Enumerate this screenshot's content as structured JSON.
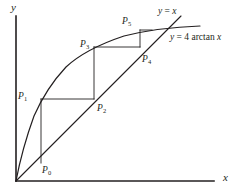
{
  "figure": {
    "kind": "cobweb-diagram",
    "background_color": "#ffffff",
    "ink_color": "#231f20"
  },
  "axes": {
    "x_axis_label": "x",
    "y_axis_label": "y",
    "x_axis_name": "x-axis",
    "y_axis_name": "y-axis",
    "origin_px": [
      16,
      181
    ],
    "x_axis_end_px": [
      214,
      181
    ],
    "y_axis_top_px": [
      16,
      16
    ]
  },
  "curve_labels": {
    "identity_line": "y = x",
    "identity_line_parts": {
      "lhs": "y",
      "eq": " = ",
      "rhs": "x"
    },
    "function_curve": "y = 4 arctan x",
    "function_curve_parts": {
      "lhs": "y",
      "eq": " = ",
      "coef": "4 ",
      "fn": "arctan ",
      "var": "x"
    }
  },
  "points": [
    {
      "id": "P0",
      "label": "P",
      "sub": "0",
      "label_x": 42,
      "label_y": 166
    },
    {
      "id": "P1",
      "label": "P",
      "sub": "1",
      "label_x": 18,
      "label_y": 92
    },
    {
      "id": "P2",
      "label": "P",
      "sub": "2",
      "label_x": 97,
      "label_y": 104
    },
    {
      "id": "P3",
      "label": "P",
      "sub": "3",
      "label_x": 80,
      "label_y": 40
    },
    {
      "id": "P4",
      "label": "P",
      "sub": "4",
      "label_x": 142,
      "label_y": 55
    },
    {
      "id": "P5",
      "label": "P",
      "sub": "5",
      "label_x": 122,
      "label_y": 17
    }
  ],
  "label_positions": {
    "y_axis_label_x": 11,
    "y_axis_label_y": 2,
    "x_axis_label_x": 223,
    "x_axis_label_y": 172,
    "identity_label_x": 158,
    "identity_label_y": 7,
    "function_label_x": 170,
    "function_label_y": 33
  },
  "chart_data": {
    "type": "line",
    "title": "",
    "xlabel": "x",
    "ylabel": "y",
    "series": [
      {
        "name": "y = 4 arctan x",
        "kind": "curve",
        "points_px": [
          [
            16,
            181
          ],
          [
            20,
            158
          ],
          [
            24,
            142
          ],
          [
            29,
            127
          ],
          [
            34,
            114
          ],
          [
            41,
            99
          ],
          [
            50,
            84
          ],
          [
            60,
            71
          ],
          [
            70,
            62
          ],
          [
            80,
            54
          ],
          [
            94,
            47
          ],
          [
            110,
            40
          ],
          [
            125,
            35
          ],
          [
            140,
            31
          ],
          [
            155,
            29
          ],
          [
            170,
            28
          ],
          [
            185,
            27
          ],
          [
            200,
            27
          ]
        ]
      },
      {
        "name": "y = x",
        "kind": "line",
        "points_px": [
          [
            16,
            181
          ],
          [
            181,
            16
          ]
        ]
      },
      {
        "name": "cobweb-path",
        "kind": "staircase",
        "points_px": [
          [
            41,
            163
          ],
          [
            41,
            99
          ],
          [
            94,
            99
          ],
          [
            94,
            47
          ],
          [
            140,
            47
          ],
          [
            140,
            30
          ]
        ]
      }
    ],
    "iterates": [
      {
        "name": "P0",
        "px": [
          41,
          163
        ]
      },
      {
        "name": "P1",
        "px": [
          41,
          99
        ]
      },
      {
        "name": "P2",
        "px": [
          94,
          99
        ]
      },
      {
        "name": "P3",
        "px": [
          94,
          47
        ]
      },
      {
        "name": "P4",
        "px": [
          140,
          47
        ]
      },
      {
        "name": "P5",
        "px": [
          140,
          30
        ]
      }
    ],
    "grid": false,
    "legend": "none"
  }
}
